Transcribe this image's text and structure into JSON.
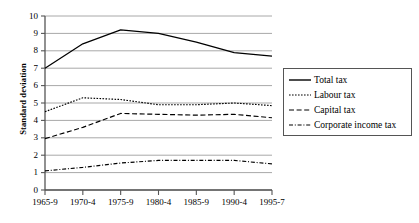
{
  "chart_data": {
    "type": "line",
    "title": "",
    "xlabel": "",
    "ylabel": "Standard deviation",
    "categories": [
      "1965-9",
      "1970-4",
      "1975-9",
      "1980-4",
      "1985-9",
      "1990-4",
      "1995-7"
    ],
    "ylim": [
      0,
      10
    ],
    "ytick_step": 1,
    "yticks": [
      "10",
      "9",
      "8",
      "7",
      "6",
      "5",
      "4",
      "3",
      "2",
      "1",
      "0"
    ],
    "grid": true,
    "grid_axis": "y",
    "legend_position": "right",
    "series": [
      {
        "name": "Total tax",
        "style": "solid",
        "values": [
          7.0,
          8.4,
          9.2,
          9.0,
          8.5,
          7.9,
          7.7
        ]
      },
      {
        "name": "Labour tax",
        "style": "dotted",
        "values": [
          4.5,
          5.3,
          5.2,
          4.9,
          4.9,
          5.0,
          4.85
        ]
      },
      {
        "name": "Capital tax",
        "style": "dashed",
        "values": [
          2.95,
          3.6,
          4.4,
          4.35,
          4.3,
          4.35,
          4.15
        ]
      },
      {
        "name": "Corporate income tax",
        "style": "dashdot",
        "values": [
          1.1,
          1.3,
          1.55,
          1.7,
          1.7,
          1.7,
          1.5
        ]
      }
    ]
  },
  "legend": {
    "entries": [
      {
        "label": "Total tax",
        "style": "solid"
      },
      {
        "label": "Labour tax",
        "style": "dotted"
      },
      {
        "label": "Capital tax",
        "style": "dashed"
      },
      {
        "label": "Corporate income tax",
        "style": "dashdot"
      }
    ]
  },
  "colors": {
    "line": "#000000",
    "grid": "#a8a8a8",
    "axis": "#555555",
    "background": "#ffffff"
  }
}
